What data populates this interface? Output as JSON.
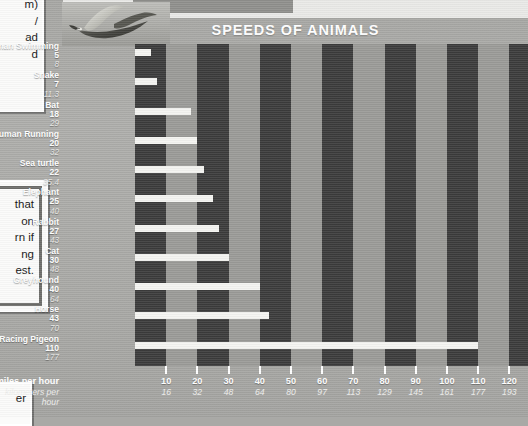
{
  "figure": {
    "title": "SPEEDS OF ANIMALS",
    "photo_caption": "racing-pigeon-photo"
  },
  "callouts": {
    "top": [
      "m)",
      "/",
      "ad",
      "d"
    ],
    "middle": [
      "that",
      "on",
      "rn if",
      "ng",
      "est."
    ],
    "bottom": [
      "er"
    ]
  },
  "axis": {
    "primary_label": "miles per hour",
    "secondary_label": "kilometers per hour",
    "mph_ticks": [
      10,
      20,
      30,
      40,
      50,
      60,
      70,
      80,
      90,
      100,
      110,
      120
    ],
    "kmh_ticks": [
      16,
      32,
      48,
      64,
      80,
      97,
      113,
      129,
      145,
      161,
      177,
      193
    ]
  },
  "chart_data": {
    "type": "bar",
    "orientation": "horizontal",
    "title": "SPEEDS OF ANIMALS",
    "xlabel": "miles per hour",
    "xlabel_secondary": "kilometers per hour",
    "ylabel": "",
    "xlim": [
      0,
      126
    ],
    "grid": "alternating vertical bands every 10 mph",
    "legend": "none",
    "categories": [
      "Human Swimming",
      "Snake",
      "Bat",
      "Human Running",
      "Sea turtle",
      "Elephant",
      "Rabbit",
      "Cat",
      "Greyhound",
      "Horse",
      "Racing Pigeon"
    ],
    "values": [
      5,
      7,
      18,
      20,
      22,
      25,
      27,
      30,
      40,
      43,
      110
    ],
    "values_kmh": [
      8,
      11.3,
      29,
      32,
      35.4,
      40,
      43,
      48,
      64,
      70,
      177
    ],
    "series": [
      {
        "name": "miles per hour",
        "values": [
          5,
          7,
          18,
          20,
          22,
          25,
          27,
          30,
          40,
          43,
          110
        ]
      },
      {
        "name": "kilometers per hour",
        "values": [
          8,
          11.3,
          29,
          32,
          35.4,
          40,
          43,
          48,
          64,
          70,
          177
        ]
      }
    ],
    "rows": [
      {
        "name": "Human Swimming",
        "mph": "5",
        "kmh": "8"
      },
      {
        "name": "Snake",
        "mph": "7",
        "kmh": "11.3"
      },
      {
        "name": "Bat",
        "mph": "18",
        "kmh": "29"
      },
      {
        "name": "Human Running",
        "mph": "20",
        "kmh": "32"
      },
      {
        "name": "Sea turtle",
        "mph": "22",
        "kmh": "35.4"
      },
      {
        "name": "Elephant",
        "mph": "25",
        "kmh": "40"
      },
      {
        "name": "Rabbit",
        "mph": "27",
        "kmh": "43"
      },
      {
        "name": "Cat",
        "mph": "30",
        "kmh": "48"
      },
      {
        "name": "Greyhound",
        "mph": "40",
        "kmh": "64"
      },
      {
        "name": "Horse",
        "mph": "43",
        "kmh": "70"
      },
      {
        "name": "Racing Pigeon",
        "mph": "110",
        "kmh": "177"
      }
    ]
  },
  "colors": {
    "page": "#a9a9a6",
    "band_dark": "#3b3b3b",
    "band_light": "#9a9a97",
    "bar": "#f4f4f1",
    "text_light": "#ffffff"
  }
}
